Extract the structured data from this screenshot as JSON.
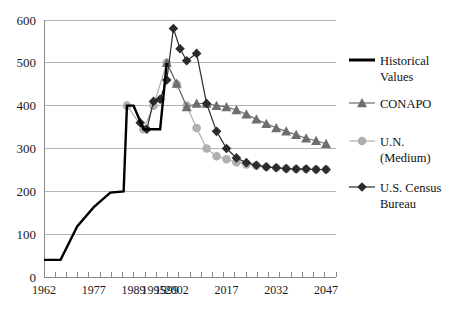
{
  "chart_data": {
    "type": "line",
    "title": "",
    "subtitle": "",
    "xlabel": "",
    "ylabel": "",
    "xlim": [
      1962,
      2050
    ],
    "ylim": [
      0,
      600
    ],
    "ytick_values": [
      0,
      100,
      200,
      300,
      400,
      500,
      600
    ],
    "ytick_labels": [
      "0",
      "100",
      "200",
      "300",
      "400",
      "500",
      "600"
    ],
    "xtick_labels": [
      "1962",
      "1977",
      "1989",
      "1995",
      "1999",
      "2002",
      "2017",
      "2032",
      "2047"
    ],
    "xtick_positions": [
      1962,
      1977,
      1989,
      1995,
      1999,
      2002,
      2017,
      2032,
      2047
    ],
    "grid": "horizontal",
    "legend_position": "right",
    "series": [
      {
        "name": "Historical Values",
        "legend_label_line1": "Historical",
        "legend_label_line2": "Values",
        "color": "#000000",
        "marker": "none",
        "linewidth": 2.4,
        "x": [
          1962,
          1967,
          1972,
          1977,
          1982,
          1986,
          1987,
          1989,
          1992,
          1995,
          1997,
          1999
        ],
        "values": [
          40,
          40,
          118,
          163,
          197,
          200,
          400,
          400,
          345,
          345,
          345,
          500
        ]
      },
      {
        "name": "CONAPO",
        "legend_label_line1": "CONAPO",
        "legend_label_line2": "",
        "color": "#6e6e6e",
        "marker": "triangle",
        "linewidth": 1.2,
        "x": [
          1999,
          2002,
          2005,
          2008,
          2011,
          2014,
          2017,
          2020,
          2023,
          2026,
          2029,
          2032,
          2035,
          2038,
          2041,
          2044,
          2047
        ],
        "values": [
          500,
          452,
          397,
          405,
          405,
          400,
          397,
          390,
          380,
          368,
          358,
          348,
          340,
          332,
          324,
          318,
          311
        ]
      },
      {
        "name": "U.N. (Medium)",
        "legend_label_line1": "U.N.",
        "legend_label_line2": "(Medium)",
        "color": "#b0b0b0",
        "marker": "circle",
        "linewidth": 1.2,
        "x": [
          1987,
          1992,
          1995,
          1999,
          2002,
          2005,
          2008,
          2011,
          2014,
          2017,
          2020,
          2023,
          2026,
          2029,
          2032,
          2035,
          2038,
          2041,
          2044,
          2047
        ],
        "values": [
          400,
          345,
          400,
          500,
          450,
          400,
          348,
          300,
          282,
          275,
          268,
          263,
          260,
          257,
          255,
          253,
          252,
          252,
          251,
          251
        ]
      },
      {
        "name": "U.S. Census Bureau",
        "legend_label_line1": "U.S. Census",
        "legend_label_line2": "Bureau",
        "color": "#2b2b2b",
        "marker": "diamond",
        "linewidth": 1.2,
        "x": [
          1991,
          1993,
          1995,
          1997,
          1999,
          2001,
          2003,
          2005,
          2008,
          2011,
          2014,
          2017,
          2020,
          2023,
          2026,
          2029,
          2032,
          2035,
          2038,
          2041,
          2044,
          2047
        ],
        "values": [
          360,
          345,
          410,
          415,
          460,
          580,
          533,
          505,
          522,
          405,
          340,
          300,
          278,
          267,
          261,
          257,
          255,
          253,
          252,
          252,
          251,
          251
        ]
      }
    ]
  },
  "legend": {
    "entries": [
      {
        "label1": "Historical",
        "label2": "Values",
        "marker": "line",
        "color": "#000000"
      },
      {
        "label1": "CONAPO",
        "label2": "",
        "marker": "triangle",
        "color": "#6e6e6e"
      },
      {
        "label1": "U.N.",
        "label2": "(Medium)",
        "marker": "circle",
        "color": "#b0b0b0"
      },
      {
        "label1": "U.S. Census",
        "label2": "Bureau",
        "marker": "diamond",
        "color": "#2b2b2b"
      }
    ]
  }
}
